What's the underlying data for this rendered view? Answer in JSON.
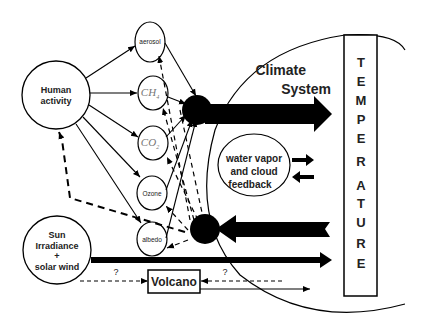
{
  "nodes": {
    "human_activity": {
      "line1": "Human",
      "line2": "activity"
    },
    "aerosol": "aerosol",
    "ch4": {
      "main": "CH",
      "sub": "4"
    },
    "co2": {
      "main": "CO",
      "sub": "2"
    },
    "ozone": "Ozone",
    "albedo": "albedo",
    "sun": {
      "line1": "Sun",
      "line2": "Irradiance",
      "line3": "+",
      "line4": "solar wind"
    },
    "volcano": "Volcano",
    "climate_system": {
      "line1": "Climate",
      "line2": "System"
    },
    "feedback": {
      "line1": "water vapor",
      "line2": "and  cloud",
      "line3": "feedback"
    },
    "temperature": [
      "T",
      "E",
      "M",
      "P",
      "E",
      "R",
      "A",
      "T",
      "U",
      "R",
      "E"
    ]
  },
  "labels": {
    "question_top": "?",
    "question_right": "?"
  },
  "colors": {
    "stroke": "#000000",
    "background": "#ffffff"
  }
}
